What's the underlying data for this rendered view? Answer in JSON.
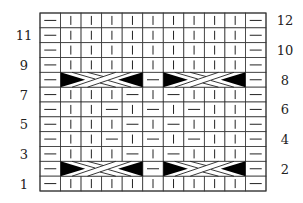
{
  "chart": {
    "columns": 11,
    "rows": 12,
    "colors": {
      "line": "#333333",
      "fill": "#000000",
      "background": "#ffffff"
    },
    "symbols": {
      "K": "knit (vertical bar)",
      "P": "purl (horizontal dash)",
      "C": "4-stitch cable cross"
    },
    "left_labels": [
      "1",
      "3",
      "5",
      "7",
      "9",
      "11"
    ],
    "right_labels": [
      "2",
      "4",
      "6",
      "8",
      "10",
      "12"
    ],
    "grid": [
      {
        "row": 12,
        "cells": [
          "P",
          "K",
          "K",
          "K",
          "K",
          "K",
          "K",
          "K",
          "K",
          "K",
          "P"
        ]
      },
      {
        "row": 11,
        "cells": [
          "P",
          "K",
          "K",
          "K",
          "K",
          "K",
          "K",
          "K",
          "K",
          "K",
          "P"
        ]
      },
      {
        "row": 10,
        "cells": [
          "P",
          "K",
          "K",
          "K",
          "K",
          "K",
          "K",
          "K",
          "K",
          "K",
          "P"
        ]
      },
      {
        "row": 9,
        "cells": [
          "P",
          "K",
          "K",
          "K",
          "K",
          "K",
          "K",
          "K",
          "K",
          "K",
          "P"
        ]
      },
      {
        "row": 8,
        "cells": [
          "P",
          "C",
          "C",
          "C",
          "C",
          "P",
          "C",
          "C",
          "C",
          "C",
          "P"
        ]
      },
      {
        "row": 7,
        "cells": [
          "P",
          "K",
          "K",
          "K",
          "P",
          "K",
          "P",
          "K",
          "K",
          "K",
          "P"
        ]
      },
      {
        "row": 6,
        "cells": [
          "P",
          "K",
          "K",
          "P",
          "K",
          "P",
          "K",
          "P",
          "K",
          "K",
          "P"
        ]
      },
      {
        "row": 5,
        "cells": [
          "P",
          "K",
          "K",
          "K",
          "P",
          "K",
          "P",
          "K",
          "K",
          "K",
          "P"
        ]
      },
      {
        "row": 4,
        "cells": [
          "P",
          "K",
          "K",
          "P",
          "K",
          "P",
          "K",
          "P",
          "K",
          "K",
          "P"
        ]
      },
      {
        "row": 3,
        "cells": [
          "P",
          "K",
          "K",
          "K",
          "P",
          "K",
          "P",
          "K",
          "K",
          "K",
          "P"
        ]
      },
      {
        "row": 2,
        "cells": [
          "P",
          "C",
          "C",
          "C",
          "C",
          "P",
          "C",
          "C",
          "C",
          "C",
          "P"
        ]
      },
      {
        "row": 1,
        "cells": [
          "P",
          "K",
          "K",
          "K",
          "K",
          "K",
          "K",
          "K",
          "K",
          "K",
          "P"
        ]
      }
    ],
    "cables": [
      {
        "row": 8,
        "start_col": 2,
        "width": 4
      },
      {
        "row": 8,
        "start_col": 7,
        "width": 4
      },
      {
        "row": 2,
        "start_col": 2,
        "width": 4
      },
      {
        "row": 2,
        "start_col": 7,
        "width": 4
      }
    ]
  }
}
